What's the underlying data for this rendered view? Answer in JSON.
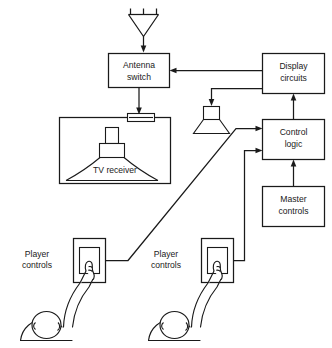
{
  "diagram": {
    "type": "block-diagram",
    "colors": {
      "ink": "#1a1a1a",
      "background": "#ffffff"
    },
    "blocks": {
      "antenna_switch": {
        "label_line1": "Antenna",
        "label_line2": "switch"
      },
      "display_circuits": {
        "label_line1": "Display",
        "label_line2": "circuits"
      },
      "control_logic": {
        "label_line1": "Control",
        "label_line2": "logic"
      },
      "master_controls": {
        "label_line1": "Master",
        "label_line2": "controls"
      },
      "tv_receiver": {
        "label": "TV receiver"
      },
      "player_controls_1": {
        "label_line1": "Player",
        "label_line2": "controls"
      },
      "player_controls_2": {
        "label_line1": "Player",
        "label_line2": "controls"
      }
    },
    "symbols": {
      "antenna": "antenna-symbol",
      "speaker": "speaker-symbol",
      "crt": "crt-tube-symbol",
      "tuner_connector": "tuner-connector-symbol",
      "player_1": "person-figure",
      "player_2": "person-figure"
    },
    "connections": [
      {
        "from": "antenna",
        "to": "antenna_switch",
        "arrow": true
      },
      {
        "from": "antenna_switch",
        "to": "tv_receiver",
        "arrow": true
      },
      {
        "from": "display_circuits",
        "to": "antenna_switch",
        "arrow": true
      },
      {
        "from": "display_circuits",
        "to": "speaker",
        "arrow": true
      },
      {
        "from": "control_logic",
        "to": "display_circuits",
        "arrow": true
      },
      {
        "from": "master_controls",
        "to": "control_logic",
        "arrow": true
      },
      {
        "from": "player_controls_1",
        "to": "control_logic",
        "arrow": true
      },
      {
        "from": "player_controls_2",
        "to": "control_logic",
        "arrow": true
      }
    ]
  }
}
